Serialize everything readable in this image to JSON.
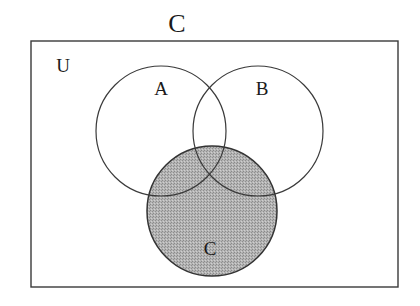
{
  "title": "C",
  "universe": {
    "label": "U",
    "box": {
      "x": 31,
      "y": 41,
      "width": 367,
      "height": 246
    }
  },
  "sets": [
    {
      "id": "A",
      "label": "A",
      "cx": 161,
      "cy": 131,
      "r": 65,
      "shaded": false,
      "label_x": 161,
      "label_y": 95
    },
    {
      "id": "B",
      "label": "B",
      "cx": 258,
      "cy": 131,
      "r": 65,
      "shaded": false,
      "label_x": 262,
      "label_y": 95
    },
    {
      "id": "C",
      "label": "C",
      "cx": 212,
      "cy": 211,
      "r": 65,
      "shaded": true,
      "label_x": 210,
      "label_y": 255
    }
  ],
  "shaded_region": "C",
  "colors": {
    "stroke": "#3a3a3a",
    "shade": "#a9a9a9",
    "background": "#ffffff"
  }
}
